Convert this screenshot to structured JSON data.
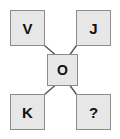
{
  "diagram": {
    "type": "node-link",
    "background_color": "#ffffff",
    "node_fill_color": "#e7e7e7",
    "node_border_color": "#8c8c8c",
    "label_color": "#111111",
    "edge_color": "#555555",
    "nodes": [
      {
        "id": "top-left",
        "label": "V",
        "position": "top-left"
      },
      {
        "id": "top-right",
        "label": "J",
        "position": "top-right"
      },
      {
        "id": "center",
        "label": "O",
        "position": "center"
      },
      {
        "id": "bottom-left",
        "label": "K",
        "position": "bottom-left"
      },
      {
        "id": "bottom-right",
        "label": "?",
        "position": "bottom-right"
      }
    ],
    "edges": [
      {
        "from": "top-left",
        "to": "center"
      },
      {
        "from": "top-right",
        "to": "center"
      },
      {
        "from": "bottom-left",
        "to": "center"
      },
      {
        "from": "bottom-right",
        "to": "center"
      }
    ]
  }
}
